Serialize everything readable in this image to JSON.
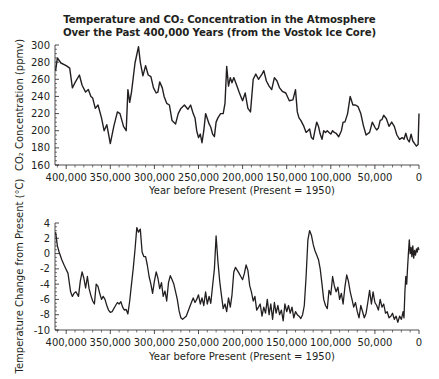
{
  "title_line1": "Temperature and CO₂ Concentration in the Atmosphere",
  "title_line2": "Over the Past 400,000 Years (from the Vostok Ice Core)",
  "line_color": "#231f20",
  "chart_data": [
    {
      "type": "line",
      "title": "CO₂ Concentration",
      "xlabel": "Year before Present (Present = 1950)",
      "ylabel": "CO₂ Concentration (ppmv)",
      "xlim": [
        412000,
        0
      ],
      "ylim": [
        160,
        300
      ],
      "grid": false,
      "x_ticks": [
        "400,000",
        "350,000",
        "300,000",
        "250,000",
        "200,000",
        "150,000",
        "100,000",
        "50,000",
        "0"
      ],
      "y_ticks": [
        "300",
        "280",
        "260",
        "240",
        "220",
        "200",
        "180",
        "160"
      ],
      "x": [
        412000,
        410000,
        406000,
        400000,
        396000,
        393000,
        390000,
        385000,
        382000,
        378000,
        375000,
        372000,
        370000,
        367000,
        364000,
        360000,
        357000,
        354000,
        350000,
        346000,
        342000,
        339000,
        335000,
        332000,
        330000,
        328000,
        326000,
        322000,
        318000,
        316000,
        313000,
        310000,
        307000,
        304000,
        301000,
        298000,
        296000,
        294000,
        291000,
        289000,
        286000,
        283000,
        280000,
        276000,
        273000,
        270000,
        266000,
        262000,
        259000,
        256000,
        254000,
        252000,
        250000,
        248000,
        246000,
        244000,
        242000,
        238000,
        236000,
        234000,
        232000,
        230000,
        228000,
        225000,
        222000,
        220000,
        218000,
        216000,
        214000,
        212000,
        210000,
        207000,
        204000,
        202000,
        200000,
        197000,
        194000,
        191000,
        188000,
        185000,
        182000,
        178000,
        176000,
        173000,
        170000,
        167000,
        164000,
        161000,
        158000,
        155000,
        151000,
        147000,
        143000,
        140000,
        138000,
        136000,
        134000,
        131000,
        128000,
        126000,
        124000,
        122000,
        120000,
        118000,
        116000,
        114000,
        112000,
        110000,
        108000,
        106000,
        104000,
        102000,
        100000,
        98000,
        96000,
        94000,
        91000,
        88000,
        86000,
        84000,
        81000,
        78000,
        75000,
        72000,
        69000,
        66000,
        63000,
        60000,
        56000,
        53000,
        50000,
        48000,
        46000,
        44000,
        42000,
        40000,
        37000,
        34000,
        31000,
        28000,
        25000,
        22000,
        19000,
        17000,
        15000,
        13000,
        11000,
        9000,
        7000,
        5000,
        3000,
        1000,
        0
      ],
      "values": [
        270,
        285,
        279,
        276,
        273,
        250,
        256,
        265,
        253,
        245,
        248,
        240,
        238,
        226,
        230,
        215,
        200,
        207,
        185,
        205,
        222,
        220,
        205,
        200,
        248,
        233,
        245,
        279,
        298,
        280,
        264,
        276,
        265,
        263,
        250,
        244,
        245,
        257,
        250,
        240,
        232,
        230,
        212,
        208,
        220,
        226,
        230,
        225,
        230,
        220,
        215,
        200,
        192,
        196,
        186,
        200,
        220,
        208,
        204,
        196,
        193,
        210,
        215,
        220,
        220,
        232,
        275,
        252,
        262,
        256,
        262,
        254,
        245,
        240,
        235,
        244,
        226,
        222,
        260,
        266,
        260,
        266,
        270,
        258,
        252,
        248,
        262,
        258,
        250,
        246,
        244,
        235,
        236,
        248,
        222,
        215,
        212,
        206,
        198,
        200,
        202,
        192,
        190,
        200,
        210,
        205,
        196,
        190,
        200,
        198,
        200,
        198,
        196,
        200,
        198,
        197,
        193,
        200,
        210,
        210,
        220,
        240,
        230,
        230,
        228,
        220,
        206,
        195,
        198,
        210,
        204,
        201,
        203,
        212,
        213,
        218,
        214,
        205,
        210,
        205,
        195,
        190,
        192,
        190,
        197,
        190,
        187,
        196,
        188,
        185,
        182,
        184,
        220,
        228,
        230,
        260,
        265,
        255,
        270,
        275,
        280,
        285
      ]
    },
    {
      "type": "line",
      "title": "Temperature Change",
      "xlabel": "Year before Present (Present = 1950)",
      "ylabel": "Temperature Change from Present (°C)",
      "xlim": [
        412000,
        0
      ],
      "ylim": [
        -10,
        4
      ],
      "grid": false,
      "x_ticks": [
        "400,000",
        "350,000",
        "300,000",
        "250,000",
        "200,000",
        "150,000",
        "100,000",
        "50,000",
        "0"
      ],
      "y_ticks": [
        "4",
        "2",
        "0",
        "-2",
        "-4",
        "-6",
        "-8",
        "-10"
      ],
      "x": [
        412000,
        410000,
        408000,
        405000,
        402000,
        398000,
        395000,
        393000,
        391000,
        389000,
        386000,
        384000,
        382000,
        380000,
        378000,
        376000,
        374000,
        372000,
        370000,
        368000,
        366000,
        364000,
        362000,
        360000,
        358000,
        356000,
        354000,
        352000,
        350000,
        348000,
        346000,
        344000,
        342000,
        340000,
        338000,
        336000,
        334000,
        332000,
        330000,
        328000,
        326000,
        324000,
        322000,
        320000,
        318000,
        316000,
        314000,
        312000,
        310000,
        308000,
        306000,
        304000,
        302000,
        300000,
        298000,
        296000,
        294000,
        292000,
        290000,
        288000,
        286000,
        284000,
        282000,
        280000,
        278000,
        276000,
        274000,
        272000,
        270000,
        268000,
        266000,
        264000,
        262000,
        260000,
        258000,
        256000,
        254000,
        252000,
        250000,
        248000,
        246000,
        244000,
        242000,
        240000,
        238000,
        236000,
        234000,
        232000,
        230000,
        228000,
        226000,
        224000,
        222000,
        220000,
        218000,
        216000,
        214000,
        212000,
        210000,
        208000,
        206000,
        204000,
        202000,
        200000,
        198000,
        196000,
        194000,
        192000,
        190000,
        188000,
        186000,
        184000,
        182000,
        180000,
        178000,
        176000,
        174000,
        172000,
        170000,
        168000,
        166000,
        164000,
        162000,
        160000,
        158000,
        156000,
        154000,
        152000,
        150000,
        148000,
        146000,
        144000,
        142000,
        140000,
        138000,
        136000,
        134000,
        132000,
        130000,
        128000,
        126000,
        124000,
        122000,
        120000,
        118000,
        116000,
        114000,
        112000,
        110000,
        108000,
        106000,
        104000,
        102000,
        100000,
        98000,
        96000,
        94000,
        92000,
        90000,
        88000,
        86000,
        84000,
        82000,
        80000,
        78000,
        76000,
        74000,
        72000,
        70000,
        68000,
        66000,
        64000,
        62000,
        60000,
        58000,
        56000,
        54000,
        52000,
        50000,
        48000,
        46000,
        44000,
        42000,
        40000,
        38000,
        36000,
        34000,
        32000,
        30000,
        28000,
        26000,
        24000,
        22000,
        20000,
        18000,
        17000,
        16000,
        15000,
        14000,
        13000,
        12000,
        11000,
        10000,
        9000,
        8000,
        7000,
        6000,
        5000,
        4000,
        3000,
        2000,
        1000,
        0
      ],
      "values": [
        2.8,
        1.0,
        0.2,
        -0.8,
        -1.6,
        -2.6,
        -5.0,
        -5.6,
        -5.2,
        -5.0,
        -5.6,
        -3.6,
        -2.4,
        -3.2,
        -4.5,
        -3.0,
        -4.6,
        -5.5,
        -6.2,
        -6.6,
        -4.0,
        -4.3,
        -5.2,
        -6.0,
        -5.6,
        -6.0,
        -6.8,
        -7.4,
        -7.7,
        -7.6,
        -7.2,
        -6.8,
        -6.4,
        -6.6,
        -6.3,
        -7.0,
        -7.4,
        -7.3,
        -7.9,
        -6.2,
        -4.0,
        -2.0,
        0.5,
        3.4,
        2.8,
        3.2,
        0.2,
        -0.4,
        -0.4,
        -1.5,
        -3.0,
        -4.0,
        -5.2,
        -3.6,
        -2.4,
        -3.2,
        -4.6,
        -3.8,
        -5.6,
        -4.9,
        -6.2,
        -3.8,
        -2.9,
        -3.4,
        -4.0,
        -5.0,
        -6.0,
        -7.5,
        -8.4,
        -8.6,
        -8.4,
        -8.2,
        -7.6,
        -7.0,
        -6.4,
        -5.8,
        -6.4,
        -6.0,
        -5.4,
        -6.6,
        -5.8,
        -6.8,
        -5.0,
        -6.6,
        -5.6,
        -6.5,
        -4.2,
        -2.0,
        2.3,
        -1.0,
        -3.6,
        -5.4,
        -7.2,
        -6.6,
        -7.6,
        -5.8,
        -7.0,
        -5.4,
        -2.4,
        -1.8,
        -2.2,
        -2.6,
        -3.0,
        -3.4,
        -2.6,
        -1.5,
        -2.2,
        -4.2,
        -5.0,
        -6.2,
        -5.6,
        -7.4,
        -7.0,
        -6.6,
        -8.2,
        -7.0,
        -7.8,
        -6.0,
        -8.0,
        -6.6,
        -8.6,
        -6.4,
        -7.8,
        -6.8,
        -8.0,
        -7.4,
        -8.8,
        -6.6,
        -7.6,
        -6.8,
        -7.8,
        -7.0,
        -8.4,
        -7.6,
        -8.0,
        -8.2,
        -8.5,
        -8.0,
        -6.8,
        -3.0,
        1.8,
        3.0,
        2.4,
        1.2,
        0.4,
        -0.2,
        -0.8,
        -2.0,
        -4.0,
        -6.0,
        -6.8,
        -7.2,
        -4.8,
        -5.4,
        -3.0,
        -4.2,
        -5.0,
        -4.4,
        -6.0,
        -5.2,
        -6.6,
        -4.4,
        -2.8,
        -3.6,
        -5.0,
        -6.0,
        -7.0,
        -6.4,
        -7.6,
        -8.4,
        -6.8,
        -7.6,
        -8.4,
        -7.8,
        -6.4,
        -4.8,
        -6.6,
        -5.0,
        -6.4,
        -6.8,
        -7.4,
        -6.0,
        -7.0,
        -6.6,
        -7.8,
        -7.6,
        -8.4,
        -8.2,
        -7.8,
        -8.6,
        -8.2,
        -9.0,
        -8.2,
        -8.6,
        -7.6,
        -8.4,
        -5.0,
        -3.0,
        -4.0,
        -2.0,
        0.0,
        1.8,
        0.0,
        0.8,
        -0.4,
        1.0,
        -0.6,
        0.4,
        -0.2,
        0.6,
        0.2,
        0.8,
        0.5
      ]
    }
  ]
}
